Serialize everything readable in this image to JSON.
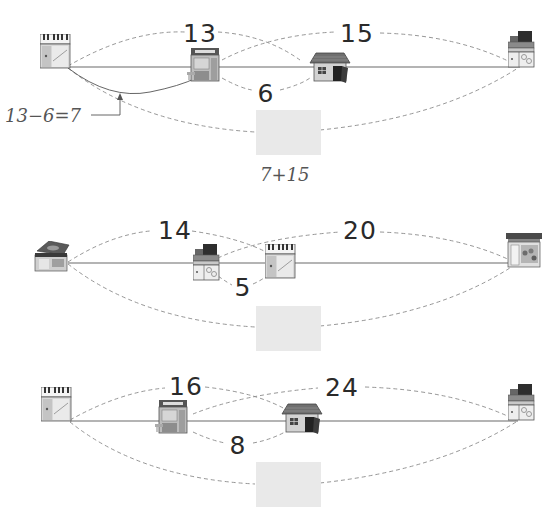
{
  "colors": {
    "line": "#6a6a6a",
    "dash": "#8a8a8a",
    "answer_box": "#e9e9e9",
    "text": "#2a2a2a",
    "hint": "#555555"
  },
  "problems": [
    {
      "id": 1,
      "places": [
        "piano-store",
        "market",
        "house",
        "toy-store"
      ],
      "labels": {
        "top_left": "13",
        "top_right": "15",
        "bottom_middle": "6"
      },
      "hint_annotation": "13−6=7",
      "hint_below_box": "7+15",
      "answer": ""
    },
    {
      "id": 2,
      "places": [
        "stationery-store",
        "toy-store",
        "piano-store",
        "florist"
      ],
      "labels": {
        "top_left": "14",
        "top_right": "20",
        "bottom_middle": "5"
      },
      "answer": ""
    },
    {
      "id": 3,
      "places": [
        "piano-store",
        "market",
        "house",
        "toy-store"
      ],
      "labels": {
        "top_left": "16",
        "top_right": "24",
        "bottom_middle": "8"
      },
      "answer": ""
    }
  ]
}
